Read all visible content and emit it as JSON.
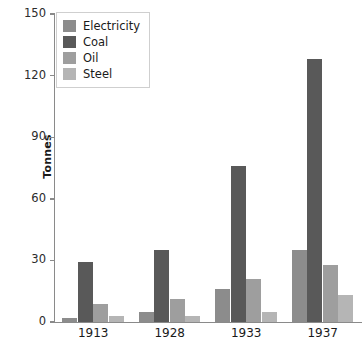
{
  "chart_data": {
    "type": "bar",
    "title": "",
    "xlabel": "",
    "ylabel": "Tonnes",
    "ylim": [
      0,
      150
    ],
    "yticks": [
      0,
      30,
      60,
      90,
      120,
      150
    ],
    "grid": false,
    "legend_position": "top-left",
    "categories": [
      "1913",
      "1928",
      "1933",
      "1937"
    ],
    "series": [
      {
        "name": "Electricity",
        "color": "#8c8c8c",
        "values": [
          2,
          5,
          16,
          35
        ]
      },
      {
        "name": "Coal",
        "color": "#595959",
        "values": [
          29,
          35,
          76,
          128
        ]
      },
      {
        "name": "Oil",
        "color": "#9e9e9e",
        "values": [
          9,
          11,
          21,
          28
        ]
      },
      {
        "name": "Steel",
        "color": "#b5b5b5",
        "values": [
          3,
          3,
          5,
          13
        ]
      }
    ]
  },
  "axis": {
    "y_title": "Tonnes",
    "y_tick_labels": [
      "0",
      "30",
      "60",
      "90",
      "120",
      "150"
    ],
    "x_tick_labels": [
      "1913",
      "1928",
      "1933",
      "1937"
    ]
  },
  "legend": {
    "items": [
      {
        "label": "Electricity",
        "color": "#8c8c8c"
      },
      {
        "label": "Coal",
        "color": "#595959"
      },
      {
        "label": "Oil",
        "color": "#9e9e9e"
      },
      {
        "label": "Steel",
        "color": "#b5b5b5"
      }
    ]
  },
  "colors": {
    "axis": "#8a8a8a",
    "text": "#1a1a1a",
    "legend_border": "#cfcfcf",
    "background": "#ffffff"
  }
}
